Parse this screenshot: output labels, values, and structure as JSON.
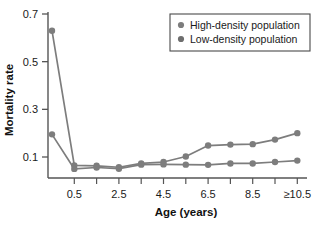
{
  "chart_data": {
    "type": "line",
    "title": "",
    "xlabel": "Age (years)",
    "ylabel": "Mortality rate",
    "x": [
      0,
      0.5,
      1.5,
      2.5,
      3.5,
      4.5,
      5.5,
      6.5,
      7.5,
      8.5,
      9.5,
      10.5
    ],
    "xtick_labels": [
      "0.5",
      "2.5",
      "4.5",
      "6.5",
      "8.5",
      "≥10.5"
    ],
    "xtick_values": [
      0.5,
      2.5,
      4.5,
      6.5,
      8.5,
      10.5
    ],
    "ytick_labels": [
      "0.1",
      "0.3",
      "0.5",
      "0.7"
    ],
    "ytick_values": [
      0.1,
      0.3,
      0.5,
      0.7
    ],
    "ylim": [
      0.03,
      0.7
    ],
    "xlim": [
      -0.5,
      11.0
    ],
    "grid": false,
    "legend_position": "top-right",
    "series": [
      {
        "name": "High-density population",
        "color": "#7d7d7d",
        "marker": "circle",
        "values": [
          0.63,
          0.065,
          0.063,
          0.057,
          0.073,
          0.079,
          0.102,
          0.148,
          0.152,
          0.154,
          0.173,
          0.2
        ]
      },
      {
        "name": "Low-density population",
        "color": "#7d7d7d",
        "marker": "circle",
        "values": [
          0.195,
          0.05,
          0.056,
          0.051,
          0.068,
          0.069,
          0.068,
          0.067,
          0.073,
          0.073,
          0.079,
          0.085
        ]
      }
    ]
  },
  "legend": {
    "entries": [
      {
        "label": "High-density population",
        "marker_color": "#7d7d7d"
      },
      {
        "label": "Low-density population",
        "marker_color": "#6e6e6e"
      }
    ]
  },
  "axes": {
    "y_title": "Mortality rate",
    "x_title": "Age (years)"
  },
  "colors": {
    "axis": "#555555",
    "line": "#7d7d7d",
    "marker": "#7d7d7d",
    "legend_border": "#4a4a4a",
    "background": "#ffffff"
  }
}
